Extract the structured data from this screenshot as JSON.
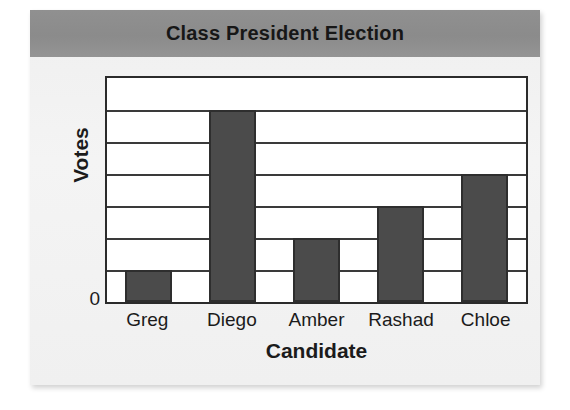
{
  "chart_data": {
    "type": "bar",
    "title": "Class President Election",
    "xlabel": "Candidate",
    "ylabel": "Votes",
    "categories": [
      "Greg",
      "Diego",
      "Amber",
      "Rashad",
      "Chloe"
    ],
    "values": [
      1,
      6,
      2,
      3,
      4
    ],
    "ylim": [
      0,
      7
    ],
    "y_tick_labels": [
      "0"
    ],
    "y_gridline_count": 7,
    "grid": true,
    "legend": "none",
    "bar_color": "#4b4b4b",
    "bar_edge_color": "#2e2e2e",
    "plot_background": "#ffffff",
    "plot_border_color": "#2b2b2b",
    "gridline_color": "#3a3a3a",
    "title_banner_color": "#8e8e8e",
    "card_background": "#f1f1f1",
    "page_background": "#ffffff",
    "text_color": "#1b1b1b"
  }
}
